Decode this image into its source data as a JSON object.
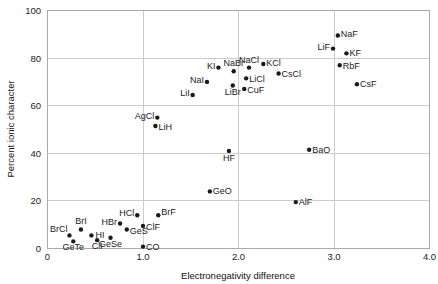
{
  "chart_data": {
    "type": "scatter",
    "title": "",
    "xlabel": "Electronegativity difference",
    "ylabel": "Percent ionic character",
    "xlim": [
      0,
      4.0
    ],
    "ylim": [
      0,
      100
    ],
    "xticks": [
      "0",
      "1.0",
      "2.0",
      "3.0",
      "4.0"
    ],
    "xtick_values": [
      0,
      1.0,
      2.0,
      3.0,
      4.0
    ],
    "yticks": [
      "0",
      "20",
      "40",
      "60",
      "80",
      "100"
    ],
    "ytick_values": [
      0,
      20,
      40,
      60,
      80,
      100
    ],
    "grid": true,
    "legend": "none",
    "points": [
      {
        "label": "BrCl",
        "x": 0.23,
        "y": 5.5,
        "lx": -2,
        "ly": -3,
        "anchor": "end"
      },
      {
        "label": "GeTe",
        "x": 0.27,
        "y": 3.0,
        "lx": 0,
        "ly": 9,
        "anchor": "middle"
      },
      {
        "label": "BrI",
        "x": 0.35,
        "y": 8.0,
        "lx": 0,
        "ly": -5,
        "anchor": "middle"
      },
      {
        "label": "HI",
        "x": 0.46,
        "y": 5.5,
        "lx": 4,
        "ly": 3,
        "anchor": "start"
      },
      {
        "label": "ClI",
        "x": 0.52,
        "y": 3.5,
        "lx": 0,
        "ly": 9,
        "anchor": "middle"
      },
      {
        "label": "GeSe",
        "x": 0.66,
        "y": 4.5,
        "lx": 0,
        "ly": 9,
        "anchor": "middle"
      },
      {
        "label": "HBr",
        "x": 0.76,
        "y": 10.5,
        "lx": -3,
        "ly": 1,
        "anchor": "end"
      },
      {
        "label": "GeS",
        "x": 0.83,
        "y": 8.0,
        "lx": 3,
        "ly": 5,
        "anchor": "start"
      },
      {
        "label": "HCl",
        "x": 0.94,
        "y": 14.0,
        "lx": -3,
        "ly": 1,
        "anchor": "end"
      },
      {
        "label": "ClF",
        "x": 1.0,
        "y": 9.5,
        "lx": 3,
        "ly": 4,
        "anchor": "start"
      },
      {
        "label": "CO",
        "x": 1.0,
        "y": 0.8,
        "lx": 3,
        "ly": 3,
        "anchor": "start"
      },
      {
        "label": "BrF",
        "x": 1.16,
        "y": 14.0,
        "lx": 3,
        "ly": 0,
        "anchor": "start"
      },
      {
        "label": "AgCl",
        "x": 1.15,
        "y": 55.0,
        "lx": -3,
        "ly": 1,
        "anchor": "end"
      },
      {
        "label": "LiH",
        "x": 1.13,
        "y": 51.5,
        "lx": 3,
        "ly": 4,
        "anchor": "start"
      },
      {
        "label": "GeO",
        "x": 1.7,
        "y": 24.0,
        "lx": 3,
        "ly": 3,
        "anchor": "start"
      },
      {
        "label": "HF",
        "x": 1.9,
        "y": 41.0,
        "lx": 0,
        "ly": 10,
        "anchor": "middle"
      },
      {
        "label": "LiI",
        "x": 1.52,
        "y": 64.5,
        "lx": -3,
        "ly": 1,
        "anchor": "end"
      },
      {
        "label": "NaI",
        "x": 1.67,
        "y": 70.0,
        "lx": -3,
        "ly": 1,
        "anchor": "end"
      },
      {
        "label": "KI",
        "x": 1.79,
        "y": 76.0,
        "lx": -3,
        "ly": 1,
        "anchor": "end"
      },
      {
        "label": "LiBr",
        "x": 1.94,
        "y": 68.5,
        "lx": 0,
        "ly": 10,
        "anchor": "middle"
      },
      {
        "label": "NaBr",
        "x": 1.95,
        "y": 74.5,
        "lx": 0,
        "ly": -5,
        "anchor": "middle"
      },
      {
        "label": "CuF",
        "x": 2.06,
        "y": 67.0,
        "lx": 3,
        "ly": 4,
        "anchor": "start"
      },
      {
        "label": "LiCl",
        "x": 2.08,
        "y": 71.5,
        "lx": 3,
        "ly": 4,
        "anchor": "start"
      },
      {
        "label": "NaCl",
        "x": 2.11,
        "y": 76.0,
        "lx": 0,
        "ly": -5,
        "anchor": "middle"
      },
      {
        "label": "KCl",
        "x": 2.26,
        "y": 77.5,
        "lx": 3,
        "ly": 2,
        "anchor": "start"
      },
      {
        "label": "CsCl",
        "x": 2.42,
        "y": 73.5,
        "lx": 3,
        "ly": 3,
        "anchor": "start"
      },
      {
        "label": "AlF",
        "x": 2.6,
        "y": 19.5,
        "lx": 3,
        "ly": 3,
        "anchor": "start"
      },
      {
        "label": "BaO",
        "x": 2.74,
        "y": 41.5,
        "lx": 3,
        "ly": 3,
        "anchor": "start"
      },
      {
        "label": "LiF",
        "x": 2.99,
        "y": 84.0,
        "lx": -3,
        "ly": 1,
        "anchor": "end"
      },
      {
        "label": "NaF",
        "x": 3.04,
        "y": 89.5,
        "lx": 3,
        "ly": 2,
        "anchor": "start"
      },
      {
        "label": "KF",
        "x": 3.13,
        "y": 82.0,
        "lx": 3,
        "ly": 3,
        "anchor": "start"
      },
      {
        "label": "RbF",
        "x": 3.06,
        "y": 77.0,
        "lx": 3,
        "ly": 4,
        "anchor": "start"
      },
      {
        "label": "CsF",
        "x": 3.24,
        "y": 69.0,
        "lx": 3,
        "ly": 3,
        "anchor": "start"
      }
    ]
  }
}
